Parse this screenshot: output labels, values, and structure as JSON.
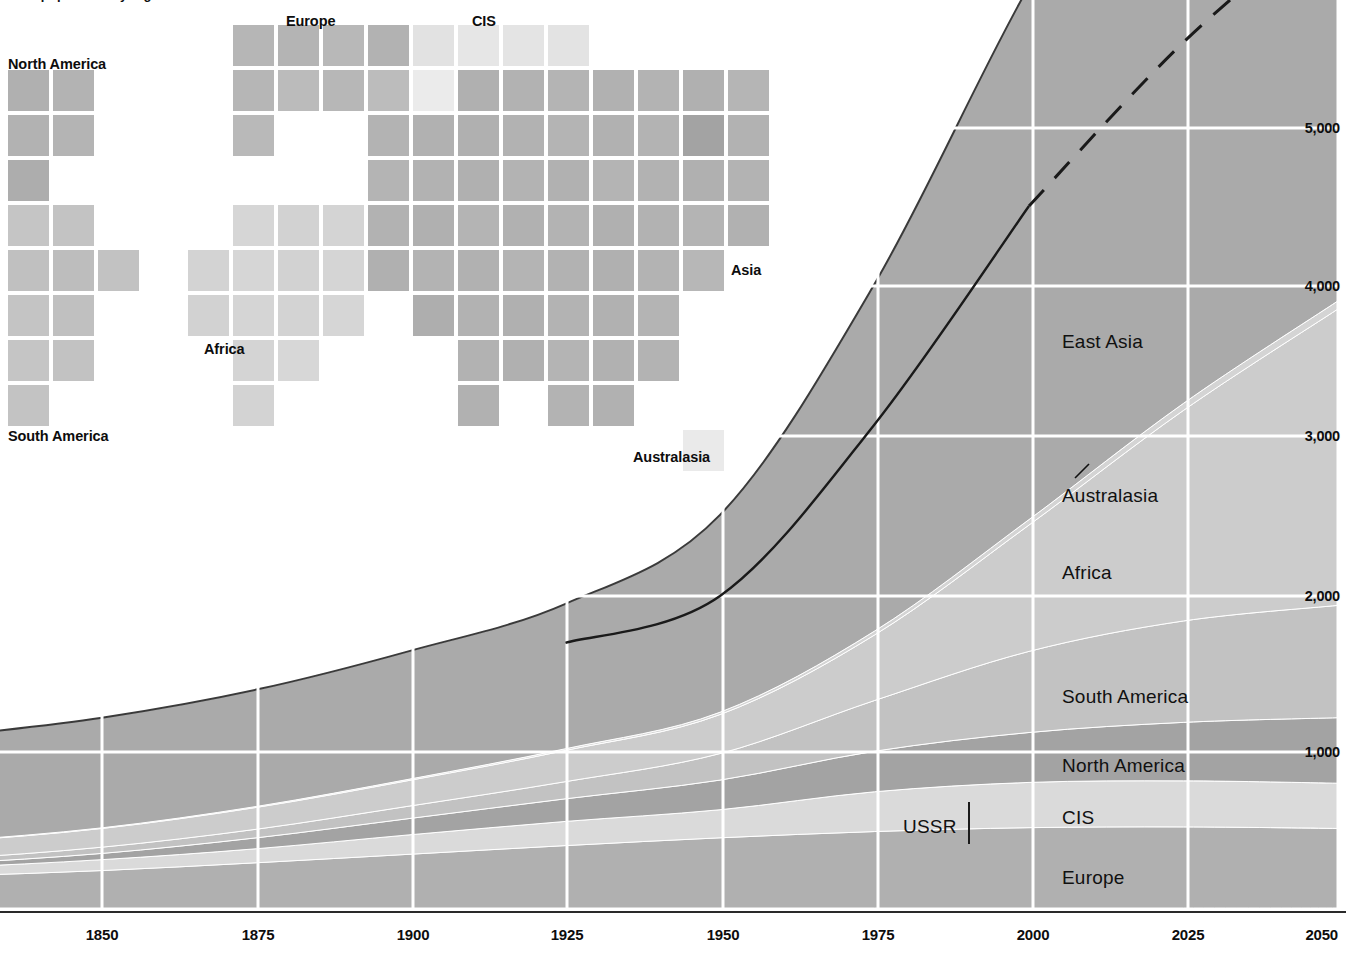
{
  "caption": {
    "text": "World population by region"
  },
  "map": {
    "labels": [
      {
        "name": "north-america",
        "text": "North America",
        "x": 8,
        "y": 57,
        "anchor": "left"
      },
      {
        "name": "europe",
        "text": "Europe",
        "x": 286,
        "y": 14,
        "anchor": "left"
      },
      {
        "name": "cis",
        "text": "CIS",
        "x": 472,
        "y": 14,
        "anchor": "left"
      },
      {
        "name": "asia",
        "text": "Asia",
        "x": 731,
        "y": 263,
        "anchor": "left"
      },
      {
        "name": "africa",
        "text": "Africa",
        "x": 204,
        "y": 342,
        "anchor": "left"
      },
      {
        "name": "south-america",
        "text": "South America",
        "x": 8,
        "y": 429,
        "anchor": "left"
      },
      {
        "name": "australasia",
        "text": "Australasia",
        "x": 633,
        "y": 450,
        "anchor": "left"
      }
    ],
    "tile_size": 41,
    "pitch": 45,
    "origin": {
      "x": 8,
      "y": 70
    },
    "colors": {
      "north_america": "#b4b4b4",
      "south_america": "#c0c0c0",
      "europe": "#b7b7b7",
      "cis": "#e4e4e4",
      "africa": "#d2d2d2",
      "asia": "#b0b0b0",
      "australasia": "#ececec"
    },
    "tiles": [
      {
        "c": 0,
        "r": 0,
        "f": "#b0b0b0"
      },
      {
        "c": 1,
        "r": 0,
        "f": "#b3b3b3"
      },
      {
        "c": 0,
        "r": 1,
        "f": "#b2b2b2"
      },
      {
        "c": 1,
        "r": 1,
        "f": "#b4b4b4"
      },
      {
        "c": 0,
        "r": 2,
        "f": "#adadad"
      },
      {
        "c": 0,
        "r": 3,
        "f": "#c5c5c5"
      },
      {
        "c": 1,
        "r": 3,
        "f": "#c3c3c3"
      },
      {
        "c": 0,
        "r": 4,
        "f": "#c0c0c0"
      },
      {
        "c": 1,
        "r": 4,
        "f": "#bdbdbd"
      },
      {
        "c": 2,
        "r": 4,
        "f": "#c2c2c2"
      },
      {
        "c": 0,
        "r": 5,
        "f": "#c4c4c4"
      },
      {
        "c": 1,
        "r": 5,
        "f": "#c0c0c0"
      },
      {
        "c": 0,
        "r": 6,
        "f": "#c5c5c5"
      },
      {
        "c": 1,
        "r": 6,
        "f": "#c2c2c2"
      },
      {
        "c": 0,
        "r": 7,
        "f": "#c3c3c3"
      },
      {
        "c": 5,
        "r": -1,
        "f": "#b6b6b6"
      },
      {
        "c": 6,
        "r": -1,
        "f": "#b4b4b4"
      },
      {
        "c": 7,
        "r": -1,
        "f": "#b8b8b8"
      },
      {
        "c": 8,
        "r": -1,
        "f": "#b2b2b2"
      },
      {
        "c": 9,
        "r": -1,
        "f": "#e2e2e2"
      },
      {
        "c": 10,
        "r": -1,
        "f": "#e6e6e6"
      },
      {
        "c": 11,
        "r": -1,
        "f": "#e4e4e4"
      },
      {
        "c": 12,
        "r": -1,
        "f": "#e3e3e3"
      },
      {
        "c": 5,
        "r": 0,
        "f": "#b6b6b6"
      },
      {
        "c": 6,
        "r": 0,
        "f": "#bbbbbb"
      },
      {
        "c": 7,
        "r": 0,
        "f": "#b7b7b7"
      },
      {
        "c": 8,
        "r": 0,
        "f": "#bcbcbc"
      },
      {
        "c": 9,
        "r": 0,
        "f": "#ebebeb"
      },
      {
        "c": 10,
        "r": 0,
        "f": "#b0b0b0"
      },
      {
        "c": 11,
        "r": 0,
        "f": "#b2b2b2"
      },
      {
        "c": 12,
        "r": 0,
        "f": "#b4b4b4"
      },
      {
        "c": 13,
        "r": 0,
        "f": "#b1b1b1"
      },
      {
        "c": 14,
        "r": 0,
        "f": "#b3b3b3"
      },
      {
        "c": 15,
        "r": 0,
        "f": "#b0b0b0"
      },
      {
        "c": 16,
        "r": 0,
        "f": "#b5b5b5"
      },
      {
        "c": 5,
        "r": 1,
        "f": "#b9b9b9"
      },
      {
        "c": 8,
        "r": 1,
        "f": "#b3b3b3"
      },
      {
        "c": 9,
        "r": 1,
        "f": "#b1b1b1"
      },
      {
        "c": 10,
        "r": 1,
        "f": "#b0b0b0"
      },
      {
        "c": 11,
        "r": 1,
        "f": "#b2b2b2"
      },
      {
        "c": 12,
        "r": 1,
        "f": "#b4b4b4"
      },
      {
        "c": 13,
        "r": 1,
        "f": "#b1b1b1"
      },
      {
        "c": 14,
        "r": 1,
        "f": "#b3b3b3"
      },
      {
        "c": 15,
        "r": 1,
        "f": "#a3a3a3"
      },
      {
        "c": 16,
        "r": 1,
        "f": "#b2b2b2"
      },
      {
        "c": 8,
        "r": 2,
        "f": "#b4b4b4"
      },
      {
        "c": 9,
        "r": 2,
        "f": "#b2b2b2"
      },
      {
        "c": 10,
        "r": 2,
        "f": "#b0b0b0"
      },
      {
        "c": 11,
        "r": 2,
        "f": "#b3b3b3"
      },
      {
        "c": 12,
        "r": 2,
        "f": "#b1b1b1"
      },
      {
        "c": 13,
        "r": 2,
        "f": "#b4b4b4"
      },
      {
        "c": 14,
        "r": 2,
        "f": "#b2b2b2"
      },
      {
        "c": 15,
        "r": 2,
        "f": "#b0b0b0"
      },
      {
        "c": 16,
        "r": 2,
        "f": "#b3b3b3"
      },
      {
        "c": 5,
        "r": 3,
        "f": "#d6d6d6"
      },
      {
        "c": 6,
        "r": 3,
        "f": "#d2d2d2"
      },
      {
        "c": 7,
        "r": 3,
        "f": "#d4d4d4"
      },
      {
        "c": 8,
        "r": 3,
        "f": "#b2b2b2"
      },
      {
        "c": 9,
        "r": 3,
        "f": "#b0b0b0"
      },
      {
        "c": 10,
        "r": 3,
        "f": "#b4b4b4"
      },
      {
        "c": 11,
        "r": 3,
        "f": "#b1b1b1"
      },
      {
        "c": 12,
        "r": 3,
        "f": "#b3b3b3"
      },
      {
        "c": 13,
        "r": 3,
        "f": "#b0b0b0"
      },
      {
        "c": 14,
        "r": 3,
        "f": "#b2b2b2"
      },
      {
        "c": 15,
        "r": 3,
        "f": "#b4b4b4"
      },
      {
        "c": 16,
        "r": 3,
        "f": "#b1b1b1"
      },
      {
        "c": 4,
        "r": 4,
        "f": "#d3d3d3"
      },
      {
        "c": 5,
        "r": 4,
        "f": "#d6d6d6"
      },
      {
        "c": 6,
        "r": 4,
        "f": "#d2d2d2"
      },
      {
        "c": 7,
        "r": 4,
        "f": "#d5d5d5"
      },
      {
        "c": 8,
        "r": 4,
        "f": "#b0b0b0"
      },
      {
        "c": 9,
        "r": 4,
        "f": "#b3b3b3"
      },
      {
        "c": 10,
        "r": 4,
        "f": "#b1b1b1"
      },
      {
        "c": 11,
        "r": 4,
        "f": "#b4b4b4"
      },
      {
        "c": 12,
        "r": 4,
        "f": "#b2b2b2"
      },
      {
        "c": 13,
        "r": 4,
        "f": "#b0b0b0"
      },
      {
        "c": 14,
        "r": 4,
        "f": "#b3b3b3"
      },
      {
        "c": 15,
        "r": 4,
        "f": "#b7b7b7"
      },
      {
        "c": 4,
        "r": 5,
        "f": "#d2d2d2"
      },
      {
        "c": 5,
        "r": 5,
        "f": "#d5d5d5"
      },
      {
        "c": 6,
        "r": 5,
        "f": "#d3d3d3"
      },
      {
        "c": 7,
        "r": 5,
        "f": "#d6d6d6"
      },
      {
        "c": 9,
        "r": 5,
        "f": "#aeaeae"
      },
      {
        "c": 10,
        "r": 5,
        "f": "#b2b2b2"
      },
      {
        "c": 11,
        "r": 5,
        "f": "#b0b0b0"
      },
      {
        "c": 12,
        "r": 5,
        "f": "#b3b3b3"
      },
      {
        "c": 13,
        "r": 5,
        "f": "#b1b1b1"
      },
      {
        "c": 14,
        "r": 5,
        "f": "#b4b4b4"
      },
      {
        "c": 5,
        "r": 6,
        "f": "#d4d4d4"
      },
      {
        "c": 6,
        "r": 6,
        "f": "#d7d7d7"
      },
      {
        "c": 10,
        "r": 6,
        "f": "#b2b2b2"
      },
      {
        "c": 11,
        "r": 6,
        "f": "#b0b0b0"
      },
      {
        "c": 12,
        "r": 6,
        "f": "#b4b4b4"
      },
      {
        "c": 13,
        "r": 6,
        "f": "#b1b1b1"
      },
      {
        "c": 14,
        "r": 6,
        "f": "#b3b3b3"
      },
      {
        "c": 5,
        "r": 7,
        "f": "#d3d3d3"
      },
      {
        "c": 10,
        "r": 7,
        "f": "#b1b1b1"
      },
      {
        "c": 12,
        "r": 7,
        "f": "#b3b3b3"
      },
      {
        "c": 13,
        "r": 7,
        "f": "#b1b1b1"
      },
      {
        "c": 15,
        "r": 8,
        "f": "#eaeaea"
      }
    ]
  },
  "chart_data": {
    "type": "area",
    "stacked": true,
    "title": "World population by region",
    "xlabel": "",
    "ylabel": "Population (millions)",
    "xlim": [
      1800,
      2050
    ],
    "ylim": [
      0,
      6000
    ],
    "grid": true,
    "y_ticks": [
      1000,
      2000,
      3000,
      4000,
      5000
    ],
    "y_tick_labels": [
      "1,000",
      "2,000",
      "3,000",
      "4,000",
      "5,000"
    ],
    "x_ticks": [
      1850,
      1875,
      1900,
      1925,
      1950,
      1975,
      2000,
      2025,
      2050
    ],
    "x_tick_labels": [
      "1850",
      "1875",
      "1900",
      "1925",
      "1950",
      "1975",
      "2000",
      "2025",
      "2050"
    ],
    "x": [
      1800,
      1825,
      1850,
      1875,
      1900,
      1925,
      1950,
      1975,
      2000,
      2025,
      2050
    ],
    "series": [
      {
        "name": "Europe",
        "color": "#b0b0b0",
        "values": [
          180,
          205,
          240,
          290,
          345,
          400,
          450,
          490,
          515,
          520,
          510
        ]
      },
      {
        "name": "CIS",
        "color": "#dadada",
        "values": [
          45,
          55,
          70,
          90,
          125,
          155,
          180,
          255,
          290,
          295,
          290
        ]
      },
      {
        "name": "North America",
        "color": "#a3a3a3",
        "values": [
          16,
          25,
          40,
          70,
          105,
          145,
          190,
          260,
          320,
          375,
          420
        ]
      },
      {
        "name": "South America",
        "color": "#c2c2c2",
        "values": [
          24,
          30,
          40,
          55,
          80,
          110,
          170,
          325,
          520,
          650,
          720
        ]
      },
      {
        "name": "Africa",
        "color": "#cccccc",
        "values": [
          100,
          110,
          120,
          140,
          165,
          200,
          250,
          420,
          810,
          1350,
          1900
        ]
      },
      {
        "name": "Australasia",
        "color": "#d4d4d4",
        "values": [
          2,
          3,
          4,
          6,
          8,
          11,
          15,
          25,
          35,
          45,
          52
        ]
      },
      {
        "name": "East Asia",
        "color": "#aaaaaa",
        "values": [
          613,
          672,
          706,
          749,
          822,
          929,
          1265,
          2225,
          3420,
          4265,
          4608
        ]
      }
    ],
    "total_line": {
      "label": "Total (historic)",
      "style": "solid",
      "color": "#1a1a1a",
      "x": [
        1925,
        1950,
        1975,
        2000
      ],
      "y": [
        1700,
        2000,
        3100,
        4500
      ],
      "projection_style": "dashed",
      "projection_x": [
        2000,
        2025,
        2050
      ],
      "projection_y": [
        4500,
        5550,
        6400
      ]
    },
    "annotations": [
      {
        "name": "ussr",
        "text": "USSR",
        "x": 1993,
        "y": 810
      },
      {
        "name": "australasia-leader",
        "text": "",
        "x": 2008,
        "y": 2950
      }
    ],
    "series_labels": [
      {
        "name": "east-asia",
        "text": "East Asia",
        "px": 1062,
        "py": 342
      },
      {
        "name": "australasia",
        "text": "Australasia",
        "px": 1062,
        "py": 496
      },
      {
        "name": "africa",
        "text": "Africa",
        "px": 1062,
        "py": 573
      },
      {
        "name": "south-america",
        "text": "South America",
        "px": 1062,
        "py": 697
      },
      {
        "name": "north-america",
        "text": "North America",
        "px": 1062,
        "py": 766
      },
      {
        "name": "cis",
        "text": "CIS",
        "px": 1062,
        "py": 818
      },
      {
        "name": "europe",
        "text": "Europe",
        "px": 1062,
        "py": 878
      }
    ],
    "y_axis_px": [
      {
        "label": "5,000",
        "py": 128
      },
      {
        "label": "4,000",
        "py": 286
      },
      {
        "label": "3,000",
        "py": 436
      },
      {
        "label": "2,000",
        "py": 596
      },
      {
        "label": "1,000",
        "py": 752
      }
    ],
    "x_axis_px": [
      {
        "label": "1850",
        "px": 102
      },
      {
        "label": "1875",
        "px": 258
      },
      {
        "label": "1900",
        "px": 413
      },
      {
        "label": "1925",
        "px": 567
      },
      {
        "label": "1950",
        "px": 723
      },
      {
        "label": "1975",
        "px": 878
      },
      {
        "label": "2000",
        "px": 1033
      },
      {
        "label": "2025",
        "px": 1188
      },
      {
        "label": "2050",
        "px": 1338
      }
    ]
  }
}
